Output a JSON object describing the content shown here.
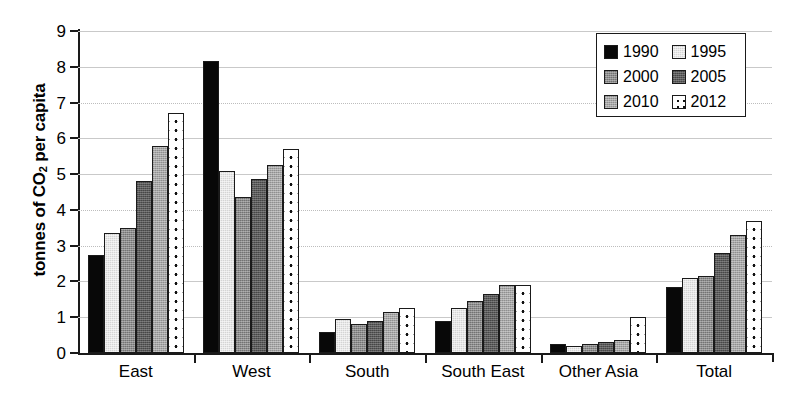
{
  "chart_data": {
    "type": "bar",
    "title": "",
    "xlabel": "",
    "ylabel": "tonnes of CO2 per capita",
    "ylabel_rich": {
      "prefix": "tonnes of CO",
      "sub": "2",
      "suffix": " per capita"
    },
    "categories": [
      "East",
      "West",
      "South",
      "South East",
      "Other Asia",
      "Total"
    ],
    "ylim": [
      0,
      9
    ],
    "yticks": [
      0,
      1,
      2,
      3,
      4,
      5,
      6,
      7,
      8,
      9
    ],
    "ytick_labels": [
      "0",
      "1",
      "2",
      "3",
      "4",
      "5",
      "6",
      "7",
      "8",
      "9"
    ],
    "grid": true,
    "legend_position": "top-right",
    "series": [
      {
        "name": "1990",
        "color": "#080808",
        "values": [
          2.75,
          8.15,
          0.6,
          0.9,
          0.25,
          1.85
        ]
      },
      {
        "name": "1995",
        "color": "#d4d4d4",
        "values": [
          3.35,
          5.1,
          0.95,
          1.25,
          0.2,
          2.1
        ]
      },
      {
        "name": "2000",
        "color": "#8c8c8c",
        "values": [
          3.5,
          4.35,
          0.8,
          1.45,
          0.25,
          2.15
        ]
      },
      {
        "name": "2005",
        "color": "#5a5a5a",
        "values": [
          4.8,
          4.85,
          0.9,
          1.65,
          0.3,
          2.8
        ]
      },
      {
        "name": "2010",
        "color": "#a6a6a6",
        "values": [
          5.8,
          5.25,
          1.15,
          1.9,
          0.35,
          3.3
        ]
      },
      {
        "name": "2012",
        "color": "#ffffff",
        "values": [
          6.7,
          5.7,
          1.25,
          1.9,
          1.0,
          3.7
        ]
      }
    ]
  },
  "legend": {
    "items": [
      {
        "label": "1990"
      },
      {
        "label": "1995"
      },
      {
        "label": "2000"
      },
      {
        "label": "2005"
      },
      {
        "label": "2010"
      },
      {
        "label": "2012"
      }
    ]
  }
}
